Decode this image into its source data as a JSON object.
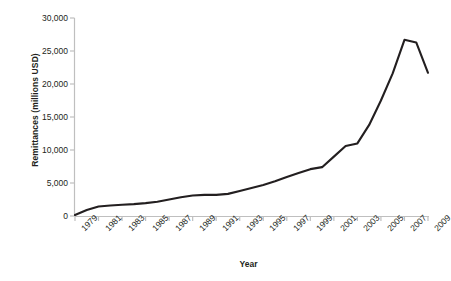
{
  "chart_data": {
    "type": "line",
    "title": "",
    "xlabel": "Year",
    "ylabel": "Remittances (millions USD)",
    "xlim": [
      1979,
      2009
    ],
    "ylim": [
      0,
      30000
    ],
    "grid": false,
    "legend": "none",
    "line_color": "#231f20",
    "axis_color": "#bfbfbf",
    "y_ticks": [
      30000,
      25000,
      20000,
      15000,
      10000,
      5000,
      0
    ],
    "y_tick_labels": [
      "30,000",
      "25,000",
      "20,000",
      "15,000",
      "10,000",
      "5,000",
      "0"
    ],
    "x_ticks": [
      1979,
      1981,
      1983,
      1985,
      1987,
      1989,
      1991,
      1993,
      1995,
      1997,
      1999,
      2001,
      2003,
      2005,
      2007,
      2009
    ],
    "x_tick_labels": [
      "1979",
      "1981",
      "1983",
      "1985",
      "1987",
      "1989",
      "1991",
      "1993",
      "1995",
      "1997",
      "1999",
      "2001",
      "2003",
      "2005",
      "2007",
      "2009"
    ],
    "series": [
      {
        "name": "Remittances",
        "x": [
          1979,
          1980,
          1981,
          1982,
          1983,
          1984,
          1985,
          1986,
          1987,
          1988,
          1989,
          1990,
          1991,
          1992,
          1993,
          1994,
          1995,
          1996,
          1997,
          1998,
          1999,
          2000,
          2001,
          2002,
          2003,
          2004,
          2005,
          2006,
          2007,
          2008,
          2009
        ],
        "values": [
          150,
          900,
          1450,
          1600,
          1700,
          1800,
          1950,
          2150,
          2500,
          2850,
          3100,
          3200,
          3200,
          3350,
          3800,
          4250,
          4700,
          5250,
          5900,
          6500,
          7100,
          7400,
          9000,
          10600,
          11000,
          13800,
          17500,
          21600,
          26700,
          26300,
          21700
        ]
      }
    ]
  }
}
